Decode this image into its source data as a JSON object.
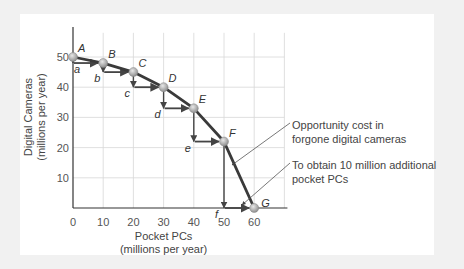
{
  "chart_data": {
    "type": "line",
    "title": "",
    "xlabel": "Pocket PCs",
    "xlabel_sub": "(millions per year)",
    "ylabel": "Digital Cameras",
    "ylabel_sub": "(millions per year)",
    "xlim": [
      0,
      60
    ],
    "ylim": [
      0,
      50
    ],
    "x_ticks": [
      "0",
      "10",
      "20",
      "30",
      "40",
      "50",
      "60"
    ],
    "y_ticks": [
      "10",
      "20",
      "30",
      "40",
      "50"
    ],
    "grid": true,
    "points": [
      {
        "label": "A",
        "x": 0,
        "y": 50
      },
      {
        "label": "B",
        "x": 10,
        "y": 48
      },
      {
        "label": "C",
        "x": 20,
        "y": 45
      },
      {
        "label": "D",
        "x": 30,
        "y": 40
      },
      {
        "label": "E",
        "x": 40,
        "y": 33
      },
      {
        "label": "F",
        "x": 50,
        "y": 22
      },
      {
        "label": "G",
        "x": 60,
        "y": 0
      }
    ],
    "step_labels": [
      "a",
      "b",
      "c",
      "d",
      "e",
      "f"
    ],
    "annotations": [
      {
        "text_line1": "Opportunity cost in",
        "text_line2": "forgone digital cameras"
      },
      {
        "text_line1": "To obtain 10 million additional",
        "text_line2": "pocket PCs"
      }
    ]
  },
  "colors": {
    "curve": "#3a3a3a",
    "arrow": "#444444",
    "grid": "#d8d8d8",
    "point_fill": "#b8b8b8",
    "panel": "#ffffff",
    "background": "#f1f1f1"
  }
}
